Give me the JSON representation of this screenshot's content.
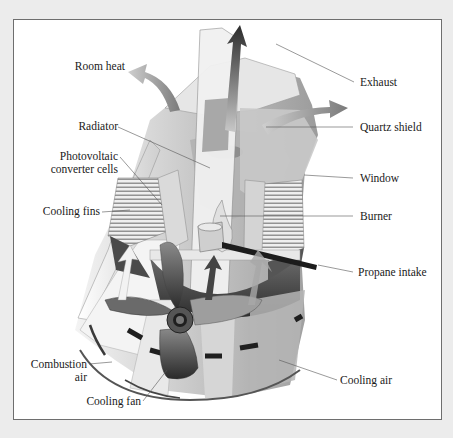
{
  "figure": {
    "labels": {
      "room_heat": "Room heat",
      "radiator": "Radiator",
      "pv_line1": "Photovoltaic",
      "pv_line2": "converter cells",
      "cooling_fins": "Cooling fins",
      "combustion_line1": "Combustion",
      "combustion_line2": "air",
      "cooling_fan": "Cooling fan",
      "exhaust": "Exhaust",
      "quartz_shield": "Quartz shield",
      "window": "Window",
      "burner": "Burner",
      "propane_intake": "Propane intake",
      "cooling_air": "Cooling air"
    },
    "colors": {
      "background": "#ececec",
      "panel": "#ffffff",
      "panel_border": "#6e6e6e",
      "text": "#1a1a1a",
      "leader_line": "#555555",
      "arrow_dark": "#3a3a3a",
      "body_gray": "#b8b8b8"
    }
  }
}
